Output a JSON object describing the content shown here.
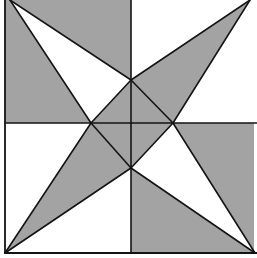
{
  "diagram": {
    "colors": {
      "shade": "#a3a3a3",
      "background": "#ffffff",
      "line": "#141414"
    },
    "square": {
      "x1": 5,
      "y1": 0,
      "x2": 254,
      "y2": 253
    },
    "center_lines": {
      "vertical_x": 131,
      "horizontal_y": 123
    },
    "points": {
      "tl": [
        10,
        0
      ],
      "tr": [
        250,
        0
      ],
      "bl": [
        5,
        253
      ],
      "br": [
        255,
        253
      ],
      "top": [
        131,
        80
      ],
      "left": [
        91,
        123
      ],
      "right": [
        173,
        123
      ],
      "bottom": [
        131,
        168
      ]
    },
    "regions": [
      {
        "name": "top-left-shaded-left",
        "fill": "shade",
        "points": [
          [
            5,
            0
          ],
          [
            10,
            0
          ],
          [
            91,
            123
          ],
          [
            5,
            123
          ]
        ]
      },
      {
        "name": "top-left-shaded-top",
        "fill": "shade",
        "points": [
          [
            10,
            0
          ],
          [
            131,
            0
          ],
          [
            131,
            80
          ]
        ]
      },
      {
        "name": "top-left-shaded-inner",
        "fill": "shade",
        "points": [
          [
            131,
            80
          ],
          [
            131,
            123
          ],
          [
            91,
            123
          ]
        ]
      },
      {
        "name": "top-right-shaded",
        "fill": "shade",
        "points": [
          [
            250,
            0
          ],
          [
            131,
            80
          ],
          [
            173,
            123
          ]
        ]
      },
      {
        "name": "top-right-shaded-inner",
        "fill": "shade",
        "points": [
          [
            131,
            123
          ],
          [
            131,
            80
          ],
          [
            173,
            123
          ]
        ]
      },
      {
        "name": "bottom-right-shaded-right",
        "fill": "shade",
        "points": [
          [
            173,
            123
          ],
          [
            254,
            123
          ],
          [
            254,
            253
          ],
          [
            255,
            253
          ]
        ]
      },
      {
        "name": "bottom-right-shaded-bottom",
        "fill": "shade",
        "points": [
          [
            131,
            168
          ],
          [
            255,
            253
          ],
          [
            131,
            253
          ]
        ]
      },
      {
        "name": "bottom-right-shaded-inner",
        "fill": "shade",
        "points": [
          [
            131,
            123
          ],
          [
            173,
            123
          ],
          [
            131,
            168
          ]
        ]
      },
      {
        "name": "bottom-left-shaded",
        "fill": "shade",
        "points": [
          [
            5,
            253
          ],
          [
            91,
            123
          ],
          [
            131,
            168
          ]
        ]
      },
      {
        "name": "bottom-left-shaded-inner",
        "fill": "shade",
        "points": [
          [
            91,
            123
          ],
          [
            131,
            123
          ],
          [
            131,
            168
          ]
        ]
      }
    ]
  }
}
